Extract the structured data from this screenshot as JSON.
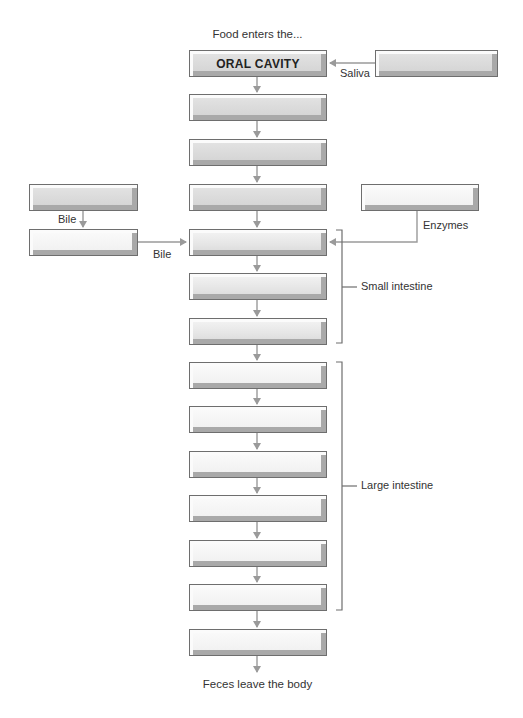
{
  "diagram": {
    "title_top": "Food enters the...",
    "title_bottom": "Feces leave the body",
    "main_boxes": [
      {
        "label": "ORAL CAVITY"
      },
      {
        "label": ""
      },
      {
        "label": ""
      },
      {
        "label": ""
      },
      {
        "label": ""
      },
      {
        "label": ""
      },
      {
        "label": ""
      },
      {
        "label": ""
      },
      {
        "label": ""
      },
      {
        "label": ""
      },
      {
        "label": ""
      },
      {
        "label": ""
      },
      {
        "label": ""
      },
      {
        "label": ""
      }
    ],
    "side_boxes": {
      "saliva_source": {
        "label": ""
      },
      "enzymes_source": {
        "label": ""
      },
      "bile_source_top": {
        "label": ""
      },
      "bile_source_bottom": {
        "label": ""
      }
    },
    "arrow_labels": {
      "saliva": "Saliva",
      "enzymes": "Enzymes",
      "bile_vertical": "Bile",
      "bile_horizontal": "Bile"
    },
    "brackets": {
      "small_intestine": "Small intestine",
      "large_intestine": "Large intestine"
    },
    "colors": {
      "arrow": "#9a9a9a",
      "bracket": "#6e6e6e",
      "box_border": "#6e6e6e"
    }
  }
}
